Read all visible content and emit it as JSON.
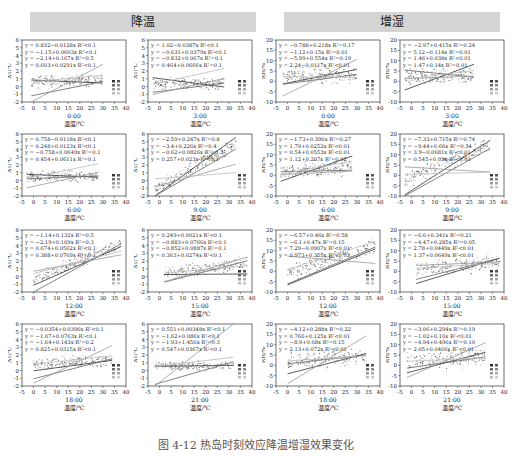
{
  "banners": {
    "left": "降温",
    "right": "增湿"
  },
  "caption": "图 4-12  热岛时刻效应降温增湿效果变化",
  "chart_data": [
    {
      "type": "scatter",
      "group": "降温",
      "time": "0:00",
      "xlabel": "温度/℃",
      "ylabel": "ΔT/℃",
      "xlim": [
        -5,
        40
      ],
      "ylim": [
        -2,
        6
      ],
      "xticks": [
        -5,
        0,
        5,
        10,
        15,
        20,
        25,
        30,
        35,
        40
      ],
      "yticks": [
        -2,
        -1,
        0,
        1,
        2,
        3,
        4,
        5,
        6
      ],
      "equations": [
        "y = 0.832−0.0128x R²<0.1",
        "y = −1.15+0.0603x R²<0.1",
        "y = −2.14+0.167x R²=0.5",
        "y = 0.603+0.0291x R²<0.1"
      ],
      "fits": [
        {
          "a": 0.832,
          "b": -0.0128
        },
        {
          "a": -1.15,
          "b": 0.0603
        },
        {
          "a": -2.14,
          "b": 0.167
        },
        {
          "a": 0.603,
          "b": 0.0291
        }
      ],
      "cloud": {
        "x": [
          -1,
          30
        ],
        "mean": 0.6,
        "slope": 0.005,
        "spread": 0.6
      }
    },
    {
      "type": "scatter",
      "group": "降温",
      "time": "3:00",
      "xlabel": "温度/℃",
      "ylabel": "ΔT/℃",
      "xlim": [
        -5,
        40
      ],
      "ylim": [
        -2,
        6
      ],
      "xticks": [
        -5,
        0,
        5,
        10,
        15,
        20,
        25,
        30,
        35,
        40
      ],
      "yticks": [
        -2,
        -1,
        0,
        1,
        2,
        3,
        4,
        5,
        6
      ],
      "equations": [
        "y = 1.02−0.0387x R²<0.1",
        "y = −0.631+0.0379x R²<0.1",
        "y = −0.832+0.067x R²=0.1",
        "y = 0.464+0.0666x R²=0.1"
      ],
      "fits": [
        {
          "a": 1.02,
          "b": -0.0387
        },
        {
          "a": -0.631,
          "b": 0.0379
        },
        {
          "a": -0.832,
          "b": 0.067
        },
        {
          "a": 0.464,
          "b": 0.0666
        }
      ],
      "cloud": {
        "x": [
          -3,
          28
        ],
        "mean": 0.4,
        "slope": 0.0,
        "spread": 0.55
      }
    },
    {
      "type": "scatter",
      "group": "增湿",
      "time": "0:00",
      "xlabel": "温度/℃",
      "ylabel": "RH/%",
      "xlim": [
        -5,
        40
      ],
      "ylim": [
        -10,
        20
      ],
      "xticks": [
        -5,
        0,
        5,
        10,
        15,
        20,
        25,
        30,
        35,
        40
      ],
      "yticks": [
        -10,
        -5,
        0,
        5,
        10,
        15,
        20
      ],
      "equations": [
        "y = −0.788+0.218x R²=0.17",
        "y = −1.12+0.15x R²=0.01",
        "y = −5.99+0.554x R²=0.19",
        "y = 2.24−0.0117x R²<0.01"
      ],
      "fits": [
        {
          "a": -0.788,
          "b": 0.218
        },
        {
          "a": -1.12,
          "b": 0.15
        },
        {
          "a": -5.99,
          "b": 0.554
        },
        {
          "a": 2.24,
          "b": -0.0117
        }
      ],
      "cloud": {
        "x": [
          -2,
          30
        ],
        "mean": 2.5,
        "slope": 0.02,
        "spread": 3
      }
    },
    {
      "type": "scatter",
      "group": "增湿",
      "time": "3:00",
      "xlabel": "温度/℃",
      "ylabel": "RH/%",
      "xlim": [
        -5,
        40
      ],
      "ylim": [
        -10,
        20
      ],
      "xticks": [
        -5,
        0,
        5,
        10,
        15,
        20,
        25,
        30,
        35,
        40
      ],
      "yticks": [
        -10,
        -5,
        0,
        5,
        10,
        15,
        20
      ],
      "equations": [
        "y = −2.97+0.415x R²=0.24",
        "y = 5.12−0.114x R²=0.01",
        "y = 1.46+0.038x R²<0.01",
        "y = 1.47+0.14x R²=0.01"
      ],
      "fits": [
        {
          "a": -2.97,
          "b": 0.415
        },
        {
          "a": 5.12,
          "b": -0.114
        },
        {
          "a": 1.46,
          "b": 0.038
        },
        {
          "a": 1.47,
          "b": 0.14
        }
      ],
      "cloud": {
        "x": [
          -3,
          27
        ],
        "mean": 2,
        "slope": 0.02,
        "spread": 3
      }
    },
    {
      "type": "scatter",
      "group": "降温",
      "time": "6:00",
      "xlabel": "温度/℃",
      "ylabel": "ΔT/℃",
      "xlim": [
        -5,
        40
      ],
      "ylim": [
        -2,
        6
      ],
      "xticks": [
        -5,
        0,
        5,
        10,
        15,
        20,
        25,
        30,
        35,
        40
      ],
      "yticks": [
        -2,
        -1,
        0,
        1,
        2,
        3,
        4,
        5,
        6
      ],
      "equations": [
        "y = 0.758−0.0118x R²<0.1",
        "y = 0.248+0.0123x R²<0.1",
        "y = −0.758+0.0649x R²=0.1",
        "y = 0.454+0.0611x R²=0.1"
      ],
      "fits": [
        {
          "a": 0.758,
          "b": -0.0118
        },
        {
          "a": 0.248,
          "b": 0.0123
        },
        {
          "a": -0.758,
          "b": 0.0649
        },
        {
          "a": 0.454,
          "b": 0.0611
        }
      ],
      "cloud": {
        "x": [
          -3,
          28
        ],
        "mean": 0.5,
        "slope": 0.0,
        "spread": 0.55
      }
    },
    {
      "type": "scatter",
      "group": "降温",
      "time": "9:00",
      "xlabel": "温度/℃",
      "ylabel": "ΔT/℃",
      "xlim": [
        -5,
        40
      ],
      "ylim": [
        -2,
        6
      ],
      "xticks": [
        -5,
        0,
        5,
        10,
        15,
        20,
        25,
        30,
        35,
        40
      ],
      "yticks": [
        -2,
        -1,
        0,
        1,
        2,
        3,
        4,
        5,
        6
      ],
      "equations": [
        "y = −2.59+0.247x R²=0.8",
        "y = −3.4+0.226x R²=0.4",
        "y = −0.62+0.0826x R²=0.3",
        "y = 0.257+0.023x R²<0.1"
      ],
      "fits": [
        {
          "a": -2.59,
          "b": 0.247
        },
        {
          "a": -3.4,
          "b": 0.226
        },
        {
          "a": -0.62,
          "b": 0.0826
        },
        {
          "a": 0.257,
          "b": 0.023
        }
      ],
      "cloud": {
        "x": [
          -2,
          33
        ],
        "mean": -1.2,
        "slope": 0.17,
        "spread": 0.7
      }
    },
    {
      "type": "scatter",
      "group": "增湿",
      "time": "6:00",
      "xlabel": "温度/℃",
      "ylabel": "RH/%",
      "xlim": [
        -5,
        40
      ],
      "ylim": [
        -10,
        20
      ],
      "xticks": [
        -5,
        0,
        5,
        10,
        15,
        20,
        25,
        30,
        35,
        40
      ],
      "yticks": [
        -10,
        -5,
        0,
        5,
        10,
        15,
        20
      ],
      "equations": [
        "y = −1.73+0.396x R²=0.27",
        "y = 1.79+0.0252x R²<0.01",
        "y = 0.54+0.0553x R²<0.01",
        "y = 1.12+0.207x R²=0.02"
      ],
      "fits": [
        {
          "a": -1.73,
          "b": 0.396
        },
        {
          "a": 1.79,
          "b": 0.0252
        },
        {
          "a": 0.54,
          "b": 0.0553
        },
        {
          "a": 1.12,
          "b": 0.207
        }
      ],
      "cloud": {
        "x": [
          -3,
          28
        ],
        "mean": 1.5,
        "slope": 0.1,
        "spread": 3
      }
    },
    {
      "type": "scatter",
      "group": "增湿",
      "time": "9:00",
      "xlabel": "温度/℃",
      "ylabel": "RH/%",
      "xlim": [
        -5,
        40
      ],
      "ylim": [
        -10,
        20
      ],
      "xticks": [
        -5,
        0,
        5,
        10,
        15,
        20,
        25,
        30,
        35,
        40
      ],
      "yticks": [
        -10,
        -5,
        0,
        5,
        10,
        15,
        20
      ],
      "equations": [
        "y = −7.33+0.715x R²=0.74",
        "y = −9.44+0.66x R²=0.34",
        "y = 3.9−0.0681x R²<0.01",
        "y = 0.545+0.03x R²<0.01"
      ],
      "fits": [
        {
          "a": -7.33,
          "b": 0.715
        },
        {
          "a": -9.44,
          "b": 0.66
        },
        {
          "a": 3.9,
          "b": -0.0681
        },
        {
          "a": 0.545,
          "b": 0.03
        }
      ],
      "cloud": {
        "x": [
          -3,
          34
        ],
        "mean": -3,
        "slope": 0.5,
        "spread": 3
      }
    },
    {
      "type": "scatter",
      "group": "降温",
      "time": "12:00",
      "xlabel": "温度/℃",
      "ylabel": "ΔT/℃",
      "xlim": [
        -5,
        40
      ],
      "ylim": [
        -2,
        6
      ],
      "xticks": [
        -5,
        0,
        5,
        10,
        15,
        20,
        25,
        30,
        35,
        40
      ],
      "yticks": [
        -2,
        -1,
        0,
        1,
        2,
        3,
        4,
        5,
        6
      ],
      "equations": [
        "y = −1.14+0.132x R²=0.5",
        "y = −2.19+0.169x R²=0.3",
        "y = 0.674+0.0562x R²<0.1",
        "y = 0.388+0.0769x R²=0.1"
      ],
      "fits": [
        {
          "a": -1.14,
          "b": 0.132
        },
        {
          "a": -2.19,
          "b": 0.169
        },
        {
          "a": 0.674,
          "b": 0.0562
        },
        {
          "a": 0.388,
          "b": 0.0769
        }
      ],
      "cloud": {
        "x": [
          0,
          38
        ],
        "mean": -0.3,
        "slope": 0.12,
        "spread": 0.6
      }
    },
    {
      "type": "scatter",
      "group": "降温",
      "time": "15:00",
      "xlabel": "温度/℃",
      "ylabel": "ΔT/℃",
      "xlim": [
        -5,
        40
      ],
      "ylim": [
        -2,
        6
      ],
      "xticks": [
        -5,
        0,
        5,
        10,
        15,
        20,
        25,
        30,
        35,
        40
      ],
      "yticks": [
        -2,
        -1,
        0,
        1,
        2,
        3,
        4,
        5,
        6
      ],
      "equations": [
        "y = 0.249+0.0021x R²<0.1",
        "y = −0.883+0.0766x R²<0.1",
        "y = −0.852+0.0887x R²=0.1",
        "y = 0.363+0.0274x R²<0.1"
      ],
      "fits": [
        {
          "a": 0.249,
          "b": 0.0021
        },
        {
          "a": -0.883,
          "b": 0.0766
        },
        {
          "a": -0.852,
          "b": 0.0887
        },
        {
          "a": 0.363,
          "b": 0.0274
        }
      ],
      "cloud": {
        "x": [
          2,
          38
        ],
        "mean": 0.3,
        "slope": 0.04,
        "spread": 0.6
      }
    },
    {
      "type": "scatter",
      "group": "增湿",
      "time": "12:00",
      "xlabel": "温度/℃",
      "ylabel": "RH/%",
      "xlim": [
        -5,
        40
      ],
      "ylim": [
        -10,
        20
      ],
      "xticks": [
        -5,
        0,
        5,
        10,
        15,
        20,
        25,
        30,
        35,
        40
      ],
      "yticks": [
        -10,
        -5,
        0,
        5,
        10,
        15,
        20
      ],
      "equations": [
        "y = −6.57+0.46x R²=0.58",
        "y = −6.1+0.47x R²=0.15",
        "y = 7.29−0.0907x R²<0.01",
        "y = 0.973+0.355x R²=0.03"
      ],
      "fits": [
        {
          "a": -6.57,
          "b": 0.46
        },
        {
          "a": -6.1,
          "b": 0.47
        },
        {
          "a": 7.29,
          "b": -0.0907
        },
        {
          "a": 0.973,
          "b": 0.355
        }
      ],
      "cloud": {
        "x": [
          0,
          38
        ],
        "mean": -1,
        "slope": 0.35,
        "spread": 3
      }
    },
    {
      "type": "scatter",
      "group": "增湿",
      "time": "15:00",
      "xlabel": "温度/℃",
      "ylabel": "RH/%",
      "xlim": [
        -5,
        40
      ],
      "ylim": [
        -10,
        20
      ],
      "xticks": [
        -5,
        0,
        5,
        10,
        15,
        20,
        25,
        30,
        35,
        40
      ],
      "yticks": [
        -10,
        -5,
        0,
        5,
        10,
        15,
        20
      ],
      "equations": [
        "y = −6.6+0.341x R²=0.21",
        "y = −4.47+0.285x R²=0.05",
        "y = 2.78+0.0449x R²<0.01",
        "y = 1.37+0.0649x R²<0.01"
      ],
      "fits": [
        {
          "a": -6.6,
          "b": 0.341
        },
        {
          "a": -4.47,
          "b": 0.285
        },
        {
          "a": 2.78,
          "b": 0.0449
        },
        {
          "a": 1.37,
          "b": 0.0649
        }
      ],
      "cloud": {
        "x": [
          2,
          38
        ],
        "mean": 1,
        "slope": 0.1,
        "spread": 3
      }
    },
    {
      "type": "scatter",
      "group": "降温",
      "time": "18:00",
      "xlabel": "温度/℃",
      "ylabel": "ΔT/℃",
      "xlim": [
        -5,
        40
      ],
      "ylim": [
        -2,
        6
      ],
      "xticks": [
        -5,
        0,
        5,
        10,
        15,
        20,
        25,
        30,
        35,
        40
      ],
      "yticks": [
        -2,
        -1,
        0,
        1,
        2,
        3,
        4,
        5,
        6
      ],
      "equations": [
        "y = −0.0354+0.0396x R²<0.1",
        "y = −1.07+0.0763x R²<0.1",
        "y = −1.64+0.143x R²=0.2",
        "y = 0.825+0.0315x R²<0.1"
      ],
      "fits": [
        {
          "a": -0.0354,
          "b": 0.0396
        },
        {
          "a": -1.07,
          "b": 0.0763
        },
        {
          "a": -1.64,
          "b": 0.143
        },
        {
          "a": 0.825,
          "b": 0.0315
        }
      ],
      "cloud": {
        "x": [
          0,
          34
        ],
        "mean": 0.7,
        "slope": 0.02,
        "spread": 0.6
      }
    },
    {
      "type": "scatter",
      "group": "降温",
      "time": "21:00",
      "xlabel": "温度/℃",
      "ylabel": "ΔT/℃",
      "xlim": [
        -5,
        40
      ],
      "ylim": [
        -2,
        6
      ],
      "xticks": [
        -5,
        0,
        5,
        10,
        15,
        20,
        25,
        30,
        35,
        40
      ],
      "yticks": [
        -2,
        -1,
        0,
        1,
        2,
        3,
        4,
        5,
        6
      ],
      "equations": [
        "y = 0.551+0.00348x R²<0.1",
        "y = −1.62+0.086x R²<0.1",
        "y = −1.93+1.456x R²=0.3",
        "y = 0.547+0.0367x R²<0.1"
      ],
      "fits": [
        {
          "a": 0.551,
          "b": 0.00348
        },
        {
          "a": -1.62,
          "b": 0.086
        },
        {
          "a": -1.93,
          "b": 1.456
        },
        {
          "a": 0.547,
          "b": 0.0367
        }
      ],
      "cloud": {
        "x": [
          -2,
          32
        ],
        "mean": 0.6,
        "slope": 0.0,
        "spread": 0.5
      }
    },
    {
      "type": "scatter",
      "group": "增湿",
      "time": "18:00",
      "xlabel": "温度/℃",
      "ylabel": "RH/%",
      "xlim": [
        -5,
        40
      ],
      "ylim": [
        -10,
        20
      ],
      "xticks": [
        -5,
        0,
        5,
        10,
        15,
        20,
        25,
        30,
        35,
        40
      ],
      "yticks": [
        -10,
        -5,
        0,
        5,
        10,
        15,
        20
      ],
      "equations": [
        "y = −4.12+0.288x R²=0.22",
        "y = 0.766+0.125x R²<0.01",
        "y = −8.9+0.68x R²=0.15",
        "y = 2.13+0.072x R²<0.01"
      ],
      "fits": [
        {
          "a": -4.12,
          "b": 0.288
        },
        {
          "a": 0.766,
          "b": 0.125
        },
        {
          "a": -8.9,
          "b": 0.68
        },
        {
          "a": 2.13,
          "b": 0.072
        }
      ],
      "cloud": {
        "x": [
          0,
          34
        ],
        "mean": 1.5,
        "slope": 0.1,
        "spread": 3
      }
    },
    {
      "type": "scatter",
      "group": "增湿",
      "time": "21:00",
      "xlabel": "温度/℃",
      "ylabel": "RH/%",
      "xlim": [
        -5,
        40
      ],
      "ylim": [
        -10,
        20
      ],
      "xticks": [
        -5,
        0,
        5,
        10,
        15,
        20,
        25,
        30,
        35,
        40
      ],
      "yticks": [
        -10,
        -5,
        0,
        5,
        10,
        15,
        20
      ],
      "equations": [
        "y = −3.06+0.294x R²=0.19",
        "y = −1.02+0.16x R²<0.01",
        "y = −4.94+0.496x R²=0.10",
        "y = 2.05+0.0466x R²<0.01"
      ],
      "fits": [
        {
          "a": -3.06,
          "b": 0.294
        },
        {
          "a": -1.02,
          "b": 0.16
        },
        {
          "a": -4.94,
          "b": 0.496
        },
        {
          "a": 2.05,
          "b": 0.0466
        }
      ],
      "cloud": {
        "x": [
          -2,
          32
        ],
        "mean": 1.5,
        "slope": 0.08,
        "spread": 3
      }
    }
  ]
}
